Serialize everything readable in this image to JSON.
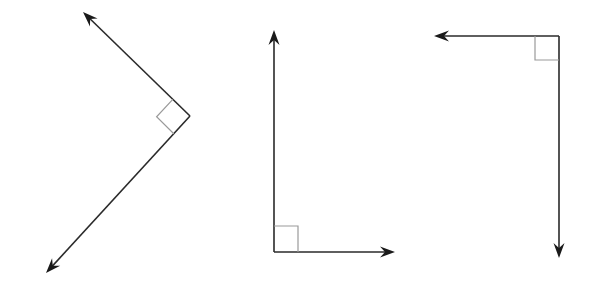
{
  "diagram": {
    "colors": {
      "background": "#ffffff",
      "ray": "#2a2a2a",
      "arrowhead": "#1a1a1a",
      "right_angle_marker": "#9a9a9a"
    },
    "angles": [
      {
        "id": "angle-1",
        "orientation": "rotated 45deg, opening left",
        "measure_deg": 90,
        "vertex": [
          190,
          116
        ],
        "rays": [
          {
            "name": "upper-left-ray",
            "tip": [
              83,
              12
            ]
          },
          {
            "name": "lower-left-ray",
            "tip": [
              46,
              273
            ]
          }
        ],
        "marker_points": [
          [
            172.8,
            99.3
          ],
          [
            156.6,
            116.8
          ],
          [
            173.8,
            133.7
          ]
        ]
      },
      {
        "id": "angle-2",
        "orientation": "L-shape, opening up-right",
        "measure_deg": 90,
        "vertex": [
          274,
          252
        ],
        "rays": [
          {
            "name": "up-ray",
            "tip": [
              274,
              30
            ]
          },
          {
            "name": "right-ray",
            "tip": [
              395,
              252
            ]
          }
        ],
        "marker_points": [
          [
            274,
            226
          ],
          [
            298,
            226
          ],
          [
            298,
            252
          ]
        ]
      },
      {
        "id": "angle-3",
        "orientation": "inverted L, opening down-left",
        "measure_deg": 90,
        "vertex": [
          559,
          36
        ],
        "rays": [
          {
            "name": "left-ray",
            "tip": [
              434,
              36
            ]
          },
          {
            "name": "down-ray",
            "tip": [
              559,
              258
            ]
          }
        ],
        "marker_points": [
          [
            535,
            36
          ],
          [
            535,
            60
          ],
          [
            559,
            60
          ]
        ]
      }
    ]
  }
}
